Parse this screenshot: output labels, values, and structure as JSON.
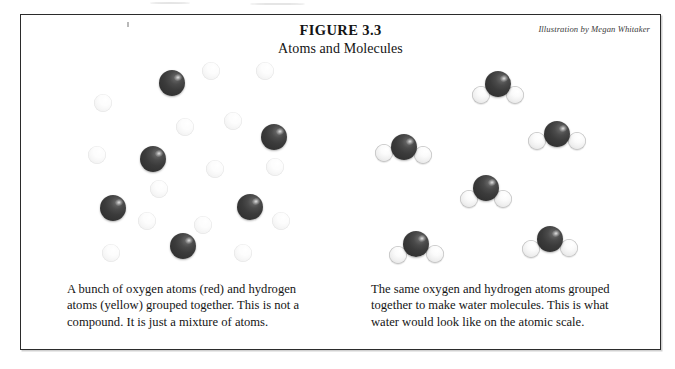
{
  "figure": {
    "title": "FIGURE 3.3",
    "subtitle": "Atoms and Molecules",
    "attribution": "Illustration by Megan Whitaker"
  },
  "captions": {
    "left": "A bunch of oxygen atoms (red) and hydrogen atoms (yellow) grouped together.  This is not a compound.  It is just a mixture of atoms.",
    "right": "The same oxygen and hydrogen atoms grouped together to make water molecules.  This is what water would look like on the atomic scale."
  },
  "colors": {
    "oxygen": "#3b3b3b",
    "hydrogen": "#f2f2f2",
    "frame": "#2b2b2b",
    "background": "#ffffff",
    "text": "#141414"
  },
  "legend": {
    "oxygen_label": "oxygen",
    "oxygen_stated_color": "red",
    "hydrogen_label": "hydrogen",
    "hydrogen_stated_color": "yellow"
  },
  "chart_data": {
    "type": "scatter",
    "title": "Atoms and Molecules",
    "panels": [
      {
        "name": "mixture-of-atoms",
        "label": "A bunch of oxygen atoms (red) and hydrogen atoms (yellow) grouped together.  This is not a compound.  It is just a mixture of atoms.",
        "oxygen_count": 6,
        "hydrogen_count": 14,
        "bonded": false,
        "oxygen_radius": 13,
        "hydrogen_radius": 9,
        "oxygen_atoms": [
          {
            "x": 105,
            "y": 22
          },
          {
            "x": 207,
            "y": 76
          },
          {
            "x": 86,
            "y": 98
          },
          {
            "x": 46,
            "y": 147
          },
          {
            "x": 183,
            "y": 146
          },
          {
            "x": 116,
            "y": 185
          }
        ],
        "hydrogen_atoms": [
          {
            "x": 144,
            "y": 10
          },
          {
            "x": 198,
            "y": 10
          },
          {
            "x": 36,
            "y": 42
          },
          {
            "x": 118,
            "y": 66
          },
          {
            "x": 166,
            "y": 60
          },
          {
            "x": 30,
            "y": 94
          },
          {
            "x": 148,
            "y": 108
          },
          {
            "x": 208,
            "y": 106
          },
          {
            "x": 92,
            "y": 128
          },
          {
            "x": 80,
            "y": 160
          },
          {
            "x": 136,
            "y": 164
          },
          {
            "x": 214,
            "y": 160
          },
          {
            "x": 44,
            "y": 192
          },
          {
            "x": 176,
            "y": 192
          }
        ]
      },
      {
        "name": "water-molecules",
        "label": "The same oxygen and hydrogen atoms grouped together to make water molecules.  This is what water would look like on the atomic scale.",
        "molecule_count": 6,
        "formula": "H2O",
        "bonded": true,
        "oxygen_radius": 13,
        "hydrogen_radius": 9,
        "molecules": [
          {
            "x": 127,
            "y": 23,
            "h_left_angle": 214,
            "h_right_angle": 326,
            "bond_len": 20
          },
          {
            "x": 33,
            "y": 86,
            "h_left_angle": 196,
            "h_right_angle": 338,
            "bond_len": 21
          },
          {
            "x": 186,
            "y": 73,
            "h_left_angle": 200,
            "h_right_angle": 340,
            "bond_len": 21
          },
          {
            "x": 115,
            "y": 127,
            "h_left_angle": 214,
            "h_right_angle": 326,
            "bond_len": 20
          },
          {
            "x": 45,
            "y": 183,
            "h_left_angle": 210,
            "h_right_angle": 332,
            "bond_len": 21
          },
          {
            "x": 179,
            "y": 178,
            "h_left_angle": 208,
            "h_right_angle": 334,
            "bond_len": 21
          }
        ]
      }
    ]
  }
}
